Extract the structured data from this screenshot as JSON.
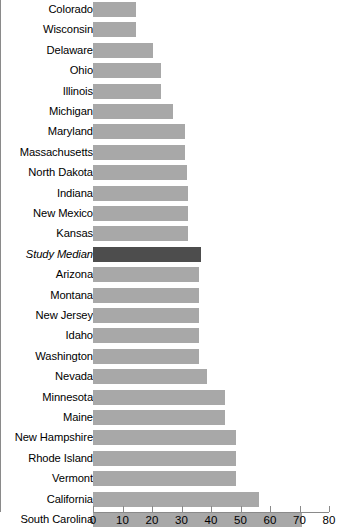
{
  "chart_data": {
    "type": "bar",
    "orientation": "horizontal",
    "title": "",
    "xlabel": "",
    "ylabel": "",
    "xlim": [
      0,
      80
    ],
    "xticks": [
      0,
      10,
      20,
      30,
      40,
      50,
      60,
      70,
      80
    ],
    "grid": false,
    "legend": null,
    "colors": {
      "bar": "#a8a8a8",
      "highlight_bar": "#4d4d4d",
      "axis": "#8a8a8a",
      "text": "#000000",
      "background": "#ffffff"
    },
    "categories": [
      "Colorado",
      "Wisconsin",
      "Delaware",
      "Ohio",
      "Illinois",
      "Michigan",
      "Maryland",
      "Massachusetts",
      "North Dakota",
      "Indiana",
      "New Mexico",
      "Kansas",
      "Study Median",
      "Arizona",
      "Montana",
      "New Jersey",
      "Idaho",
      "Washington",
      "Nevada",
      "Minnesota",
      "Maine",
      "New Hampshire",
      "Rhode Island",
      "Vermont",
      "California",
      "South Carolina"
    ],
    "values": [
      14.5,
      14.5,
      20.5,
      23.0,
      23.0,
      27.2,
      31.2,
      31.2,
      31.7,
      32.3,
      32.3,
      32.3,
      36.5,
      35.9,
      35.9,
      35.9,
      35.9,
      35.9,
      38.5,
      44.8,
      44.8,
      48.5,
      48.5,
      48.5,
      56.2,
      70.7
    ],
    "highlight_index": 12,
    "highlight_label": "Study Median"
  }
}
